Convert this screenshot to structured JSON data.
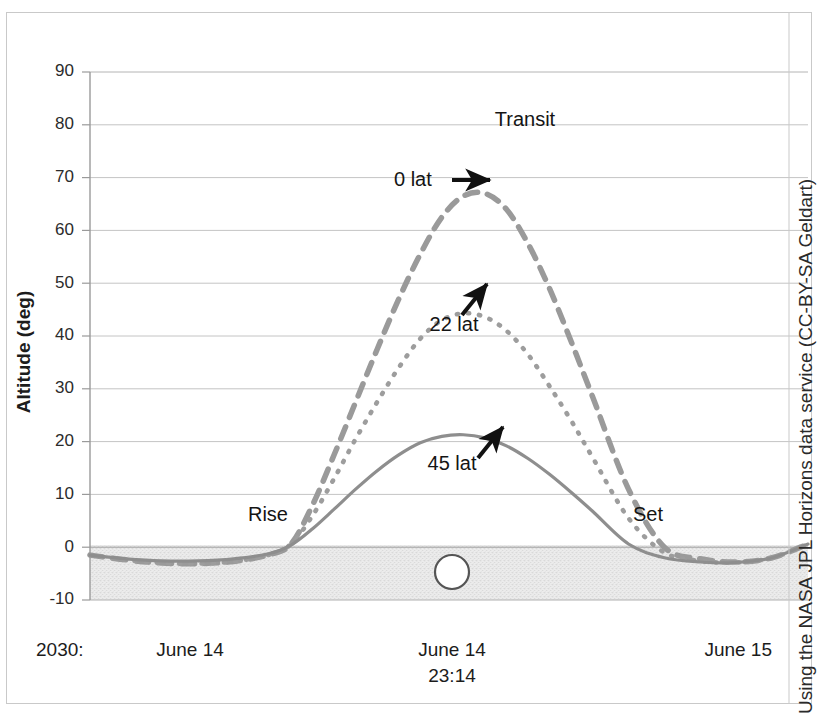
{
  "figure": {
    "credit": "Using the NASA JPL Horizons data service (CC-BY-SA Geldart)",
    "horizon_marker": "body-disc-icon"
  },
  "chart_data": {
    "type": "line",
    "title": "",
    "xlabel": "",
    "ylabel": "Altitude (deg)",
    "ylim": [
      -10,
      90
    ],
    "yticks": [
      -10,
      0,
      10,
      20,
      30,
      40,
      50,
      60,
      70,
      80,
      90
    ],
    "ytick_labels": [
      "-10",
      "0",
      "10",
      "20",
      "30",
      "40",
      "50",
      "60",
      "70",
      "80",
      "90"
    ],
    "grid": "horizontal",
    "legend": "inline-annotations",
    "x_axis_labels": {
      "year_prefix": "2030:",
      "left": "June 14",
      "center_line1": "June 14",
      "center_line2": "23:14",
      "right": "June 15"
    },
    "annotations": [
      {
        "text": "Transit",
        "kind": "event-label"
      },
      {
        "text": "Rise",
        "kind": "event-label"
      },
      {
        "text": "Set",
        "kind": "event-label"
      },
      {
        "text": "0 lat",
        "kind": "series-callout",
        "arrow": "right"
      },
      {
        "text": "22 lat",
        "kind": "series-callout",
        "arrow": "up"
      },
      {
        "text": "45 lat",
        "kind": "series-callout",
        "arrow": "up"
      }
    ],
    "series": [
      {
        "name": "0 lat",
        "style": "dashed",
        "color": "#9a9a9a",
        "peak_altitude_deg": 67,
        "x_frac": [
          0.0,
          0.05,
          0.1,
          0.15,
          0.2,
          0.25,
          0.28,
          0.31,
          0.34,
          0.37,
          0.4,
          0.43,
          0.46,
          0.49,
          0.52,
          0.55,
          0.58,
          0.61,
          0.64,
          0.67,
          0.7,
          0.75,
          0.8,
          0.85,
          0.9,
          0.95,
          1.0
        ],
        "values": [
          -1.5,
          -2.4,
          -3.0,
          -3.1,
          -2.7,
          -1.4,
          0.6,
          8.0,
          17.5,
          27.5,
          37.5,
          47.0,
          55.5,
          62.5,
          66.5,
          67.0,
          64.0,
          57.5,
          49.0,
          39.0,
          28.5,
          11.0,
          0.0,
          -2.2,
          -2.8,
          -2.0,
          0.6
        ]
      },
      {
        "name": "22 lat",
        "style": "dotted",
        "color": "#9d9d9d",
        "peak_altitude_deg": 44,
        "x_frac": [
          0.0,
          0.05,
          0.1,
          0.15,
          0.2,
          0.25,
          0.28,
          0.31,
          0.34,
          0.37,
          0.4,
          0.43,
          0.46,
          0.49,
          0.52,
          0.55,
          0.58,
          0.61,
          0.64,
          0.67,
          0.7,
          0.75,
          0.8,
          0.85,
          0.9,
          0.95,
          1.0
        ],
        "values": [
          -1.5,
          -2.4,
          -3.0,
          -3.1,
          -2.7,
          -1.4,
          0.6,
          6.0,
          13.0,
          20.5,
          27.5,
          34.0,
          39.5,
          43.0,
          44.3,
          43.6,
          41.0,
          36.5,
          30.5,
          24.0,
          17.0,
          5.5,
          -1.0,
          -2.6,
          -2.9,
          -2.0,
          0.6
        ]
      },
      {
        "name": "45 lat",
        "style": "solid",
        "color": "#8e8e8e",
        "peak_altitude_deg": 21,
        "x_frac": [
          0.0,
          0.05,
          0.1,
          0.15,
          0.2,
          0.25,
          0.28,
          0.31,
          0.34,
          0.37,
          0.4,
          0.43,
          0.46,
          0.49,
          0.52,
          0.55,
          0.58,
          0.61,
          0.64,
          0.67,
          0.7,
          0.75,
          0.8,
          0.85,
          0.9,
          0.95,
          1.0
        ],
        "values": [
          -1.5,
          -2.2,
          -2.6,
          -2.6,
          -2.2,
          -1.2,
          0.4,
          3.5,
          7.2,
          11.0,
          14.5,
          17.5,
          19.8,
          21.0,
          21.3,
          20.7,
          19.2,
          16.8,
          13.8,
          10.4,
          6.8,
          0.6,
          -2.0,
          -2.8,
          -2.9,
          -2.0,
          0.6
        ]
      }
    ],
    "horizon_band": {
      "from": -10,
      "to": 0,
      "label": "below-horizon-shading"
    }
  }
}
